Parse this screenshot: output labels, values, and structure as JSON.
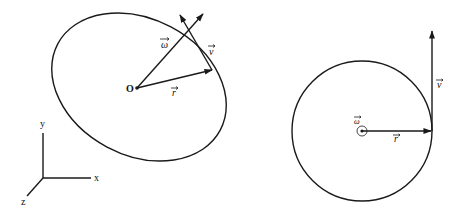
{
  "left_diagram": {
    "title": "",
    "origin_label": "O",
    "vectors": {
      "omega": {
        "label": "ω",
        "has_arrow_overbar": true
      },
      "v": {
        "label": "v",
        "has_arrow_overbar": true
      },
      "r": {
        "label": "r",
        "has_arrow_overbar": true
      }
    },
    "axes": {
      "x_label": "x",
      "y_label": "y",
      "z_label": "z"
    },
    "shape": "tilted-ellipse"
  },
  "right_diagram": {
    "shape": "circle",
    "vectors": {
      "omega": {
        "label": "ω",
        "has_arrow_overbar": true,
        "direction": "out-of-page"
      },
      "v": {
        "label": "v",
        "has_arrow_overbar": true
      },
      "r": {
        "label": "r",
        "has_arrow_overbar": true
      }
    }
  },
  "colors": {
    "ink": "#1a1a1a",
    "background": "#ffffff"
  }
}
